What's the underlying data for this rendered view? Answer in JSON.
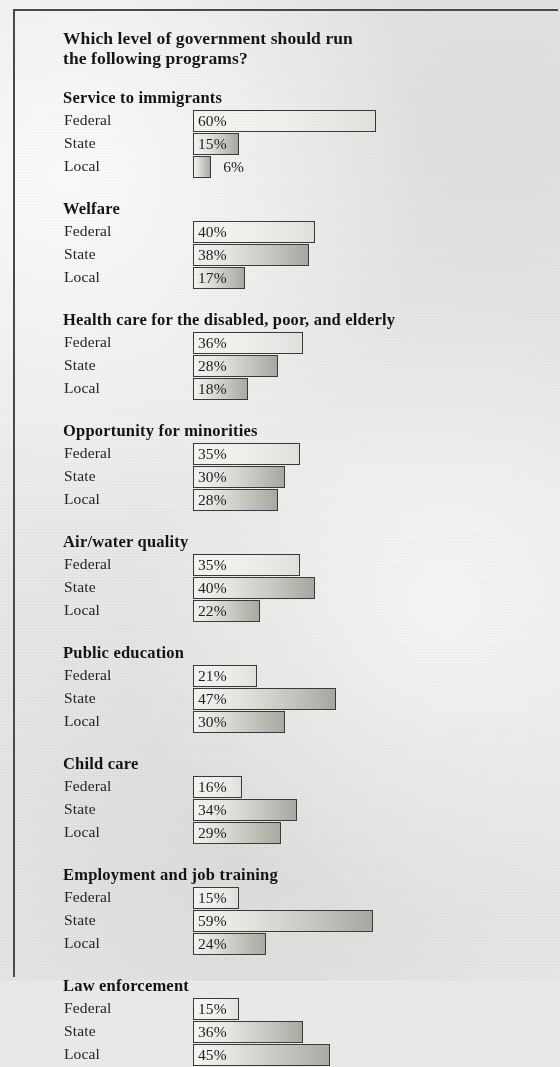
{
  "title": "Which level of government should run the following programs?",
  "title_line1": "Which level of government should run",
  "title_line2": "the following programs?",
  "levels": [
    "Federal",
    "State",
    "Local"
  ],
  "chart_data": {
    "type": "bar",
    "title": "Which level of government should run the following programs?",
    "xlabel": "",
    "ylabel": "",
    "orientation": "horizontal",
    "grid": false,
    "legend": "none",
    "value_suffix": "%",
    "xlim": [
      0,
      60
    ],
    "categories": [
      "Federal",
      "State",
      "Local"
    ],
    "groups": [
      {
        "name": "Service to immigrants",
        "values": [
          60,
          15,
          6
        ],
        "labels": [
          "60%",
          "15%",
          "6%"
        ],
        "label_placement": [
          "inside",
          "inside",
          "outside"
        ]
      },
      {
        "name": "Welfare",
        "values": [
          40,
          38,
          17
        ],
        "labels": [
          "40%",
          "38%",
          "17%"
        ],
        "label_placement": [
          "inside",
          "inside",
          "inside"
        ]
      },
      {
        "name": "Health care for the disabled, poor, and elderly",
        "values": [
          36,
          28,
          18
        ],
        "labels": [
          "36%",
          "28%",
          "18%"
        ],
        "label_placement": [
          "inside",
          "inside",
          "inside"
        ]
      },
      {
        "name": "Opportunity for minorities",
        "values": [
          35,
          30,
          28
        ],
        "labels": [
          "35%",
          "30%",
          "28%"
        ],
        "label_placement": [
          "inside",
          "inside",
          "inside"
        ]
      },
      {
        "name": "Air/water quality",
        "values": [
          35,
          40,
          22
        ],
        "labels": [
          "35%",
          "40%",
          "22%"
        ],
        "label_placement": [
          "inside",
          "inside",
          "inside"
        ]
      },
      {
        "name": "Public education",
        "values": [
          21,
          47,
          30
        ],
        "labels": [
          "21%",
          "47%",
          "30%"
        ],
        "label_placement": [
          "inside",
          "inside",
          "inside"
        ]
      },
      {
        "name": "Child care",
        "values": [
          16,
          34,
          29
        ],
        "labels": [
          "16%",
          "34%",
          "29%"
        ],
        "label_placement": [
          "inside",
          "inside",
          "inside"
        ]
      },
      {
        "name": "Employment and job training",
        "values": [
          15,
          59,
          24
        ],
        "labels": [
          "15%",
          "59%",
          "24%"
        ],
        "label_placement": [
          "inside",
          "inside",
          "inside"
        ]
      },
      {
        "name": "Law enforcement",
        "values": [
          15,
          36,
          45
        ],
        "labels": [
          "15%",
          "36%",
          "45%"
        ],
        "label_placement": [
          "inside",
          "inside",
          "inside"
        ]
      }
    ]
  },
  "style": {
    "page_background": "#ececeb",
    "frame_color": "#4a4a48",
    "bar_border": "#3a3a3c",
    "bar_fill_light": "#f4f4f1",
    "bar_fill_dark": "#a9a9a2",
    "text_color": "#1d1d20",
    "pixels_per_percent": 3.05,
    "bar_origin_x": 193
  }
}
